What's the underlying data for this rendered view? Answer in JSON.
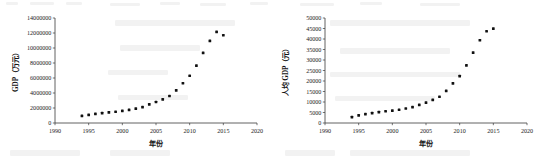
{
  "figure": {
    "panel_count": 2
  },
  "chart_data": [
    {
      "type": "scatter",
      "title": "",
      "xlabel": "年份",
      "ylabel": "GDP（万元）",
      "xlim": [
        1990,
        2020
      ],
      "ylim": [
        0,
        14000000
      ],
      "xticks": [
        1990,
        1995,
        2000,
        2005,
        2010,
        2015,
        2020
      ],
      "xtick_labels": [
        "1990",
        "1995",
        "2000",
        "2005",
        "2010",
        "2015",
        "2020"
      ],
      "yticks": [
        0,
        2000000,
        4000000,
        6000000,
        8000000,
        10000000,
        12000000,
        14000000
      ],
      "ytick_labels": [
        "0",
        "2000000",
        "4000000",
        "6000000",
        "8000000",
        "10000000",
        "12000000",
        "14000000"
      ],
      "grid": false,
      "legend": null,
      "marker": "filled-diamond",
      "marker_color": "#111111",
      "x": [
        1994,
        1995,
        1996,
        1997,
        1998,
        1999,
        2000,
        2001,
        2002,
        2003,
        2004,
        2005,
        2006,
        2007,
        2008,
        2009,
        2010,
        2011,
        2012,
        2013,
        2014,
        2015
      ],
      "values": [
        950000,
        1080000,
        1230000,
        1330000,
        1420000,
        1500000,
        1620000,
        1760000,
        1920000,
        2120000,
        2480000,
        2800000,
        3150000,
        3600000,
        4350000,
        5300000,
        6300000,
        7650000,
        9350000,
        10950000,
        12150000,
        11700000
      ]
    },
    {
      "type": "scatter",
      "title": "",
      "xlabel": "年份",
      "ylabel": "人均 GDP（元）",
      "xlim": [
        1990,
        2020
      ],
      "ylim": [
        0,
        50000
      ],
      "xticks": [
        1990,
        1995,
        2000,
        2005,
        2010,
        2015,
        2020
      ],
      "xtick_labels": [
        "1990",
        "1995",
        "2000",
        "2005",
        "2010",
        "2015",
        "2020"
      ],
      "yticks": [
        0,
        5000,
        10000,
        15000,
        20000,
        25000,
        30000,
        35000,
        40000,
        45000,
        50000
      ],
      "ytick_labels": [
        "0",
        "5000",
        "10000",
        "15000",
        "20000",
        "25000",
        "30000",
        "35000",
        "40000",
        "45000",
        "50000"
      ],
      "grid": false,
      "legend": null,
      "marker": "filled-diamond",
      "marker_color": "#111111",
      "x": [
        1994,
        1995,
        1996,
        1997,
        1998,
        1999,
        2000,
        2001,
        2002,
        2003,
        2004,
        2005,
        2006,
        2007,
        2008,
        2009,
        2010,
        2011,
        2012,
        2013,
        2014,
        2015
      ],
      "values": [
        2800,
        3600,
        4200,
        4700,
        5200,
        5600,
        5900,
        6300,
        6900,
        7600,
        8600,
        9700,
        11000,
        12500,
        15300,
        18900,
        22300,
        27400,
        33500,
        39400,
        43700,
        44900
      ]
    },
    {
      "type": "scatter",
      "note": "duplicate-guard"
    }
  ]
}
